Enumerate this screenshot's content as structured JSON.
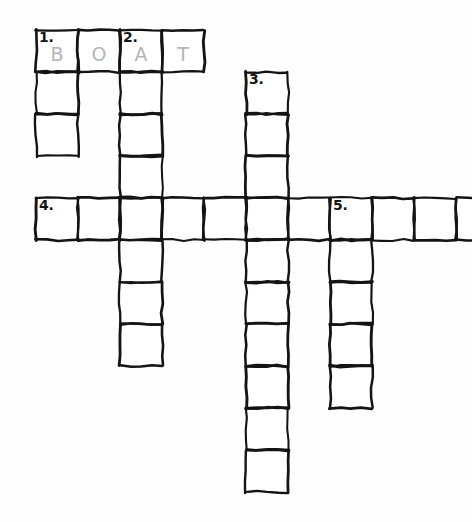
{
  "puzzle": {
    "title": "Crossword Puzzle Grid",
    "background_color": "#ffffff",
    "ink_color": "#141414",
    "letter_color": "#b4b4b4",
    "cell_size": 42,
    "origin_x": 36,
    "origin_y": 30,
    "grid_columns": 11,
    "grid_rows": 11,
    "entries": [
      {
        "number": "1.",
        "direction": "across",
        "row": 0,
        "col": 0,
        "length": 4,
        "answer": "BOAT",
        "filled": true
      },
      {
        "number": "1.",
        "direction": "down",
        "row": 0,
        "col": 0,
        "length": 3,
        "answer": "",
        "filled": false
      },
      {
        "number": "2.",
        "direction": "down",
        "row": 0,
        "col": 2,
        "length": 8,
        "answer": "",
        "filled": false
      },
      {
        "number": "3.",
        "direction": "down",
        "row": 1,
        "col": 5,
        "length": 10,
        "answer": "",
        "filled": false
      },
      {
        "number": "4.",
        "direction": "across",
        "row": 4,
        "col": 0,
        "length": 11,
        "answer": "",
        "filled": false
      },
      {
        "number": "5.",
        "direction": "down",
        "row": 4,
        "col": 7,
        "length": 5,
        "answer": "",
        "filled": false
      }
    ],
    "cells": [
      {
        "id": "c-r0-c0",
        "row": 0,
        "col": 0,
        "number": "1.",
        "letter": "B"
      },
      {
        "id": "c-r0-c1",
        "row": 0,
        "col": 1,
        "number": "",
        "letter": "O"
      },
      {
        "id": "c-r0-c2",
        "row": 0,
        "col": 2,
        "number": "2.",
        "letter": "A"
      },
      {
        "id": "c-r0-c3",
        "row": 0,
        "col": 3,
        "number": "",
        "letter": "T"
      },
      {
        "id": "c-r1-c0",
        "row": 1,
        "col": 0,
        "number": "",
        "letter": ""
      },
      {
        "id": "c-r1-c2",
        "row": 1,
        "col": 2,
        "number": "",
        "letter": ""
      },
      {
        "id": "c-r1-c5",
        "row": 1,
        "col": 5,
        "number": "3.",
        "letter": ""
      },
      {
        "id": "c-r2-c0",
        "row": 2,
        "col": 0,
        "number": "",
        "letter": ""
      },
      {
        "id": "c-r2-c2",
        "row": 2,
        "col": 2,
        "number": "",
        "letter": ""
      },
      {
        "id": "c-r2-c5",
        "row": 2,
        "col": 5,
        "number": "",
        "letter": ""
      },
      {
        "id": "c-r3-c2",
        "row": 3,
        "col": 2,
        "number": "",
        "letter": ""
      },
      {
        "id": "c-r3-c5",
        "row": 3,
        "col": 5,
        "number": "",
        "letter": ""
      },
      {
        "id": "c-r4-c0",
        "row": 4,
        "col": 0,
        "number": "4.",
        "letter": ""
      },
      {
        "id": "c-r4-c1",
        "row": 4,
        "col": 1,
        "number": "",
        "letter": ""
      },
      {
        "id": "c-r4-c2",
        "row": 4,
        "col": 2,
        "number": "",
        "letter": ""
      },
      {
        "id": "c-r4-c3",
        "row": 4,
        "col": 3,
        "number": "",
        "letter": ""
      },
      {
        "id": "c-r4-c4",
        "row": 4,
        "col": 4,
        "number": "",
        "letter": ""
      },
      {
        "id": "c-r4-c5",
        "row": 4,
        "col": 5,
        "number": "",
        "letter": ""
      },
      {
        "id": "c-r4-c6",
        "row": 4,
        "col": 6,
        "number": "",
        "letter": ""
      },
      {
        "id": "c-r4-c7",
        "row": 4,
        "col": 7,
        "number": "5.",
        "letter": ""
      },
      {
        "id": "c-r4-c8",
        "row": 4,
        "col": 8,
        "number": "",
        "letter": ""
      },
      {
        "id": "c-r4-c9",
        "row": 4,
        "col": 9,
        "number": "",
        "letter": ""
      },
      {
        "id": "c-r4-c10",
        "row": 4,
        "col": 10,
        "number": "",
        "letter": ""
      },
      {
        "id": "c-r5-c2",
        "row": 5,
        "col": 2,
        "number": "",
        "letter": ""
      },
      {
        "id": "c-r5-c5",
        "row": 5,
        "col": 5,
        "number": "",
        "letter": ""
      },
      {
        "id": "c-r5-c7",
        "row": 5,
        "col": 7,
        "number": "",
        "letter": ""
      },
      {
        "id": "c-r6-c2",
        "row": 6,
        "col": 2,
        "number": "",
        "letter": ""
      },
      {
        "id": "c-r6-c5",
        "row": 6,
        "col": 5,
        "number": "",
        "letter": ""
      },
      {
        "id": "c-r6-c7",
        "row": 6,
        "col": 7,
        "number": "",
        "letter": ""
      },
      {
        "id": "c-r7-c2",
        "row": 7,
        "col": 2,
        "number": "",
        "letter": ""
      },
      {
        "id": "c-r7-c5",
        "row": 7,
        "col": 5,
        "number": "",
        "letter": ""
      },
      {
        "id": "c-r7-c7",
        "row": 7,
        "col": 7,
        "number": "",
        "letter": ""
      },
      {
        "id": "c-r8-c5",
        "row": 8,
        "col": 5,
        "number": "",
        "letter": ""
      },
      {
        "id": "c-r8-c7",
        "row": 8,
        "col": 7,
        "number": "",
        "letter": ""
      },
      {
        "id": "c-r9-c5",
        "row": 9,
        "col": 5,
        "number": "",
        "letter": ""
      },
      {
        "id": "c-r10-c5",
        "row": 10,
        "col": 5,
        "number": "",
        "letter": ""
      }
    ]
  }
}
